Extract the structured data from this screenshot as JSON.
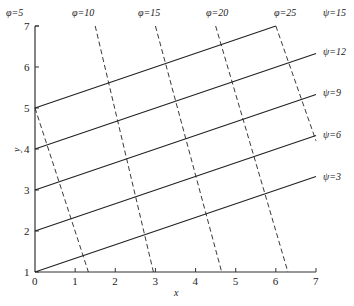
{
  "diagram": {
    "type": "flow-net",
    "x_axis": {
      "label": "x",
      "ticks": [
        "0",
        "1",
        "2",
        "3",
        "4",
        "5",
        "6",
        "7"
      ]
    },
    "y_axis": {
      "label": "y",
      "ticks": [
        "1",
        "2",
        "3",
        "4",
        "5",
        "6",
        "7"
      ]
    },
    "psi_lines": [
      {
        "label": "ψ=3",
        "start": [
          0,
          1
        ],
        "end": [
          7,
          3.33
        ]
      },
      {
        "label": "ψ=6",
        "start": [
          0,
          2
        ],
        "end": [
          7,
          4.33
        ]
      },
      {
        "label": "ψ=9",
        "start": [
          0,
          3
        ],
        "end": [
          7,
          5.33
        ]
      },
      {
        "label": "ψ=12",
        "start": [
          0,
          4
        ],
        "end": [
          7,
          6.33
        ]
      },
      {
        "label": "ψ=15",
        "start": [
          0,
          5
        ],
        "end": [
          6,
          7
        ]
      }
    ],
    "phi_lines": [
      {
        "label": "φ=5",
        "start": [
          0,
          5
        ],
        "end": [
          1.33,
          1
        ]
      },
      {
        "label": "φ=10",
        "start": [
          1.5,
          7
        ],
        "end": [
          2.95,
          1
        ]
      },
      {
        "label": "φ=15",
        "start": [
          3.0,
          7
        ],
        "end": [
          4.65,
          1
        ]
      },
      {
        "label": "φ=20",
        "start": [
          4.5,
          7
        ],
        "end": [
          6.3,
          1
        ]
      },
      {
        "label": "φ=25",
        "start": [
          6,
          7
        ],
        "end": [
          7,
          4.2
        ]
      }
    ],
    "colors": {
      "line": "#222222",
      "background": "#ffffff"
    }
  },
  "labels": {
    "phi": [
      "φ=5",
      "φ=10",
      "φ=15",
      "φ=20",
      "φ=25"
    ],
    "psi": [
      "ψ=15",
      "ψ=12",
      "ψ=9",
      "ψ=6",
      "ψ=3"
    ],
    "x": "x",
    "y": "y"
  }
}
